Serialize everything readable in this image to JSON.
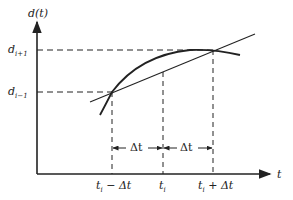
{
  "diagram": {
    "axes": {
      "y_label": "d(t)",
      "x_label": "t"
    },
    "y_levels": [
      {
        "label_base": "d",
        "label_sub": "i+1",
        "y": 50
      },
      {
        "label_base": "d",
        "label_sub": "i−1",
        "y": 92
      }
    ],
    "x_ticks": [
      {
        "label_base": "t",
        "label_sub": "i",
        "label_suffix": " − Δt",
        "x": 112
      },
      {
        "label_base": "t",
        "label_sub": "i",
        "label_suffix": "",
        "x": 163
      },
      {
        "label_base": "t",
        "label_sub": "i",
        "label_suffix": " + Δt",
        "x": 213
      }
    ],
    "intervals": [
      {
        "label": "Δt",
        "from": "t_i − Δt",
        "to": "t_i"
      },
      {
        "label": "Δt",
        "from": "t_i",
        "to": "t_i + Δt"
      }
    ],
    "curve": "d(t)",
    "secant": "line through (t_i − Δt, d_{i−1}) and (t_i + Δt, d_{i+1})",
    "colors": {
      "stroke": "#222222",
      "background": "#ffffff"
    }
  }
}
